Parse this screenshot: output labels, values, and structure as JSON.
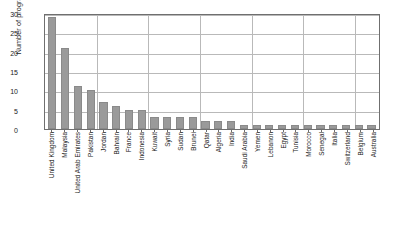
{
  "chart_data": {
    "type": "bar",
    "title": "",
    "xlabel": "",
    "ylabel": "Number of programs",
    "ylim": [
      0,
      30
    ],
    "yticks": [
      0,
      5,
      10,
      15,
      20,
      25,
      30
    ],
    "grid": true,
    "legend": null,
    "orientation": "vertical",
    "bar_color": "#9a9a9a",
    "grid_color": "#b9b9b9",
    "axis_color": "#6f6f6f",
    "categories": [
      "United Kingdom",
      "Malaysia",
      "United Arab Emirates",
      "Pakistan",
      "Jordan",
      "Bahrain",
      "France",
      "Indonesia",
      "Kuwait",
      "Syria",
      "Sudan",
      "Brunei",
      "Qatar",
      "Algeria",
      "India",
      "Saudi Arabia",
      "Yemen",
      "Lebanon",
      "Egypt",
      "Tunisia",
      "Morocco",
      "Senegal",
      "Italia",
      "Switzerland",
      "Belgium",
      "Australia"
    ],
    "values": [
      29,
      21,
      11,
      10,
      7,
      6,
      5,
      5,
      3,
      3,
      3,
      3,
      2,
      2,
      2,
      1,
      1,
      1,
      1,
      1,
      1,
      1,
      1,
      1,
      1,
      1
    ]
  }
}
